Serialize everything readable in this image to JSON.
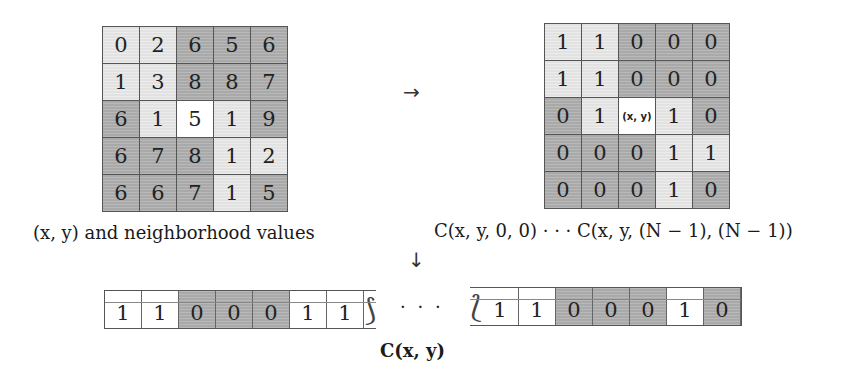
{
  "neighborhood_grid": {
    "caption": "(x, y) and neighborhood values",
    "rows": [
      [
        {
          "v": "0",
          "shade": "light"
        },
        {
          "v": "2",
          "shade": "light"
        },
        {
          "v": "6",
          "shade": "dark"
        },
        {
          "v": "5",
          "shade": "dark"
        },
        {
          "v": "6",
          "shade": "dark"
        }
      ],
      [
        {
          "v": "1",
          "shade": "light"
        },
        {
          "v": "3",
          "shade": "light"
        },
        {
          "v": "8",
          "shade": "dark"
        },
        {
          "v": "8",
          "shade": "dark"
        },
        {
          "v": "7",
          "shade": "dark"
        }
      ],
      [
        {
          "v": "6",
          "shade": "dark"
        },
        {
          "v": "1",
          "shade": "light"
        },
        {
          "v": "5",
          "shade": "center"
        },
        {
          "v": "1",
          "shade": "light"
        },
        {
          "v": "9",
          "shade": "dark"
        }
      ],
      [
        {
          "v": "6",
          "shade": "dark"
        },
        {
          "v": "7",
          "shade": "dark"
        },
        {
          "v": "8",
          "shade": "dark"
        },
        {
          "v": "1",
          "shade": "light"
        },
        {
          "v": "2",
          "shade": "light"
        }
      ],
      [
        {
          "v": "6",
          "shade": "dark"
        },
        {
          "v": "6",
          "shade": "dark"
        },
        {
          "v": "7",
          "shade": "dark"
        },
        {
          "v": "1",
          "shade": "light"
        },
        {
          "v": "5",
          "shade": "dark"
        }
      ]
    ]
  },
  "comparison_grid": {
    "caption": "C(x, y, 0, 0) · · · C(x, y, (N − 1), (N − 1))",
    "center_label": "(x, y)",
    "rows": [
      [
        {
          "v": "1",
          "shade": "light"
        },
        {
          "v": "1",
          "shade": "light"
        },
        {
          "v": "0",
          "shade": "dark"
        },
        {
          "v": "0",
          "shade": "dark"
        },
        {
          "v": "0",
          "shade": "dark"
        }
      ],
      [
        {
          "v": "1",
          "shade": "light"
        },
        {
          "v": "1",
          "shade": "light"
        },
        {
          "v": "0",
          "shade": "dark"
        },
        {
          "v": "0",
          "shade": "dark"
        },
        {
          "v": "0",
          "shade": "dark"
        }
      ],
      [
        {
          "v": "0",
          "shade": "dark"
        },
        {
          "v": "1",
          "shade": "light"
        },
        {
          "v": "(x, y)",
          "shade": "center"
        },
        {
          "v": "1",
          "shade": "light"
        },
        {
          "v": "0",
          "shade": "dark"
        }
      ],
      [
        {
          "v": "0",
          "shade": "dark"
        },
        {
          "v": "0",
          "shade": "dark"
        },
        {
          "v": "0",
          "shade": "dark"
        },
        {
          "v": "1",
          "shade": "light"
        },
        {
          "v": "1",
          "shade": "light"
        }
      ],
      [
        {
          "v": "0",
          "shade": "dark"
        },
        {
          "v": "0",
          "shade": "dark"
        },
        {
          "v": "0",
          "shade": "dark"
        },
        {
          "v": "1",
          "shade": "light"
        },
        {
          "v": "0",
          "shade": "dark"
        }
      ]
    ]
  },
  "arrows": {
    "right": "→",
    "down": "↓"
  },
  "vector": {
    "caption": "C(x, y)",
    "ellipsis": "· · ·",
    "head": [
      "1",
      "1",
      "0",
      "0",
      "0",
      "1",
      "1"
    ],
    "tail": [
      "1",
      "1",
      "0",
      "0",
      "0",
      "1",
      "0"
    ]
  },
  "colors": {
    "light_cell": "#e2e2e2",
    "dark_cell": "#a9a9a9",
    "center_cell": "#ffffff",
    "border": "#555555"
  }
}
